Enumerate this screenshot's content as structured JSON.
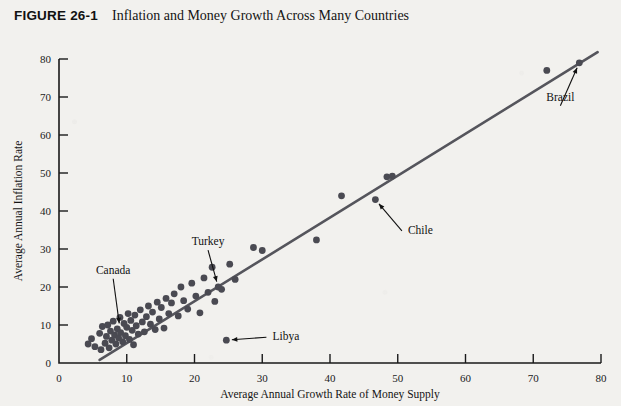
{
  "figure": {
    "number": "FIGURE 26-1",
    "title": "Inflation and Money Growth Across Many Countries"
  },
  "colors": {
    "background": "#f2f1ee",
    "point": "#4a4a52",
    "line": "#55555c",
    "axis": "#1a1a1a",
    "text": "#111111"
  },
  "chart_data": {
    "type": "scatter",
    "title": "Inflation and Money Growth Across Many Countries",
    "xlabel": "Average Annual Growth Rate of Money Supply",
    "ylabel": "Average Annual Inflation Rate",
    "xlim": [
      0,
      80
    ],
    "ylim": [
      0,
      80
    ],
    "xticks": [
      0,
      10,
      20,
      30,
      40,
      50,
      60,
      70,
      80
    ],
    "yticks": [
      0,
      10,
      20,
      30,
      40,
      50,
      60,
      70,
      80
    ],
    "grid": false,
    "legend": false,
    "fit_line": {
      "label": "regression line",
      "x_start": 6.0,
      "y_start": 0.8,
      "x_end": 79.5,
      "y_end": 81.8
    },
    "points": [
      {
        "x": 4.3,
        "y": 5.0
      },
      {
        "x": 4.8,
        "y": 6.4
      },
      {
        "x": 5.3,
        "y": 4.3
      },
      {
        "x": 6.0,
        "y": 7.8
      },
      {
        "x": 6.2,
        "y": 3.5
      },
      {
        "x": 6.4,
        "y": 9.6
      },
      {
        "x": 6.8,
        "y": 5.2
      },
      {
        "x": 7.0,
        "y": 7.0
      },
      {
        "x": 7.2,
        "y": 10.0
      },
      {
        "x": 7.4,
        "y": 4.0
      },
      {
        "x": 7.6,
        "y": 8.4
      },
      {
        "x": 7.8,
        "y": 6.0
      },
      {
        "x": 8.0,
        "y": 11.0
      },
      {
        "x": 8.2,
        "y": 7.4
      },
      {
        "x": 8.4,
        "y": 5.0
      },
      {
        "x": 8.6,
        "y": 9.0
      },
      {
        "x": 8.8,
        "y": 6.6
      },
      {
        "x": 9.0,
        "y": 12.0
      },
      {
        "x": 9.1,
        "y": 8.0
      },
      {
        "x": 9.4,
        "y": 5.6
      },
      {
        "x": 9.6,
        "y": 10.4
      },
      {
        "x": 9.8,
        "y": 7.2
      },
      {
        "x": 10.0,
        "y": 9.4
      },
      {
        "x": 10.2,
        "y": 13.0
      },
      {
        "x": 10.4,
        "y": 6.2
      },
      {
        "x": 10.6,
        "y": 11.2
      },
      {
        "x": 10.8,
        "y": 8.6
      },
      {
        "x": 11.0,
        "y": 4.8
      },
      {
        "x": 11.2,
        "y": 12.6
      },
      {
        "x": 11.4,
        "y": 9.8
      },
      {
        "x": 11.7,
        "y": 7.6
      },
      {
        "x": 12.0,
        "y": 14.0
      },
      {
        "x": 12.3,
        "y": 10.8
      },
      {
        "x": 12.6,
        "y": 8.2
      },
      {
        "x": 12.9,
        "y": 12.2
      },
      {
        "x": 13.2,
        "y": 15.0
      },
      {
        "x": 13.5,
        "y": 10.2
      },
      {
        "x": 13.8,
        "y": 13.4
      },
      {
        "x": 14.2,
        "y": 8.8
      },
      {
        "x": 14.5,
        "y": 16.0
      },
      {
        "x": 14.8,
        "y": 11.6
      },
      {
        "x": 15.1,
        "y": 14.6
      },
      {
        "x": 15.5,
        "y": 9.2
      },
      {
        "x": 15.8,
        "y": 17.0
      },
      {
        "x": 16.2,
        "y": 13.0
      },
      {
        "x": 16.6,
        "y": 15.8
      },
      {
        "x": 17.0,
        "y": 18.2
      },
      {
        "x": 17.6,
        "y": 12.4
      },
      {
        "x": 18.0,
        "y": 20.0
      },
      {
        "x": 18.4,
        "y": 16.4
      },
      {
        "x": 19.0,
        "y": 14.2
      },
      {
        "x": 19.6,
        "y": 21.0
      },
      {
        "x": 20.2,
        "y": 17.6
      },
      {
        "x": 20.8,
        "y": 13.2
      },
      {
        "x": 21.4,
        "y": 22.4
      },
      {
        "x": 22.0,
        "y": 18.6
      },
      {
        "x": 22.6,
        "y": 25.2
      },
      {
        "x": 23.0,
        "y": 16.2
      },
      {
        "x": 23.5,
        "y": 20.0
      },
      {
        "x": 24.0,
        "y": 19.4
      },
      {
        "x": 24.7,
        "y": 6.0
      },
      {
        "x": 25.2,
        "y": 26.0
      },
      {
        "x": 26.0,
        "y": 22.0
      },
      {
        "x": 28.7,
        "y": 30.4
      },
      {
        "x": 30.0,
        "y": 29.6
      },
      {
        "x": 38.0,
        "y": 32.4
      },
      {
        "x": 41.7,
        "y": 44.0
      },
      {
        "x": 46.7,
        "y": 43.0
      },
      {
        "x": 48.4,
        "y": 49.0
      },
      {
        "x": 49.2,
        "y": 49.2
      },
      {
        "x": 72.0,
        "y": 77.0
      },
      {
        "x": 76.8,
        "y": 79.0
      }
    ],
    "annotations": [
      {
        "label": "Canada",
        "point_x": 9.0,
        "point_y": 9.0,
        "label_x": 8.0,
        "label_y": 23.5
      },
      {
        "label": "Turkey",
        "point_x": 23.5,
        "point_y": 20.0,
        "label_x": 22.0,
        "label_y": 31.0
      },
      {
        "label": "Libya",
        "point_x": 24.7,
        "point_y": 6.0,
        "label_x": 31.5,
        "label_y": 6.0
      },
      {
        "label": "Chile",
        "point_x": 46.7,
        "point_y": 43.0,
        "label_x": 51.5,
        "label_y": 34.0
      },
      {
        "label": "Brazil",
        "point_x": 76.8,
        "point_y": 79.0,
        "label_x": 74.0,
        "label_y": 69.0
      }
    ]
  }
}
